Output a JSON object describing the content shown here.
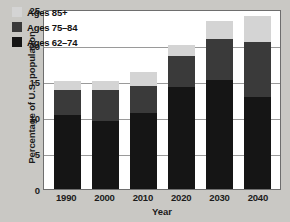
{
  "chart_data": {
    "type": "bar",
    "subtype": "stacked-bar",
    "title": "",
    "xlabel": "Year",
    "ylabel": "Percentage of U.S. population",
    "categories": [
      "1990",
      "2000",
      "2010",
      "2020",
      "2030",
      "2040"
    ],
    "ylim": [
      0,
      25
    ],
    "yticks": [
      0,
      5,
      10,
      15,
      20,
      25
    ],
    "ytick_labels": [
      "0",
      "5",
      "10",
      "15",
      "20",
      "25"
    ],
    "grid": true,
    "grid_axis": "y",
    "legend_position": "top-left",
    "stack_order_bottom_to_top": [
      "Ages 62–74",
      "Ages 75–84",
      "Ages 85+"
    ],
    "series": [
      {
        "name": "Ages 62–74",
        "color": "#151515",
        "values": [
          10.3,
          9.4,
          10.5,
          14.2,
          15.1,
          12.8
        ]
      },
      {
        "name": "Ages 75–84",
        "color": "#3a3a3a",
        "values": [
          3.5,
          4.3,
          3.8,
          4.3,
          5.8,
          7.6
        ]
      },
      {
        "name": "Ages 85+",
        "color": "#d4d4d4",
        "values": [
          1.2,
          1.3,
          1.9,
          1.5,
          2.4,
          3.6
        ]
      }
    ],
    "totals": [
      15.0,
      15.0,
      16.2,
      20.0,
      23.3,
      24.0
    ]
  },
  "legend": {
    "items": [
      {
        "label": "Ages 85+",
        "color": "#d4d4d4"
      },
      {
        "label": "Ages 75–84",
        "color": "#3a3a3a"
      },
      {
        "label": "Ages 62–74",
        "color": "#151515"
      }
    ]
  },
  "colors": {
    "page_background": "#c9c8c4",
    "plot_background": "#ffffff",
    "axis_frame": "#6e6e6e",
    "gridline": "#9a9a9a",
    "text": "#1b1b1b"
  }
}
